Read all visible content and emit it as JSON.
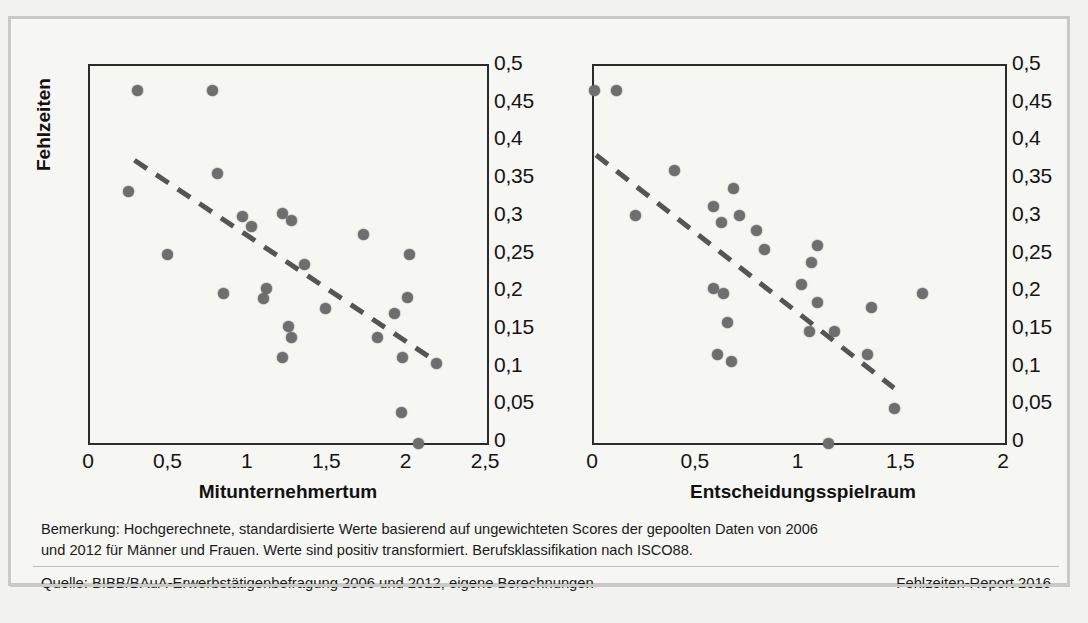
{
  "figure": {
    "note_lines": [
      "Bemerkung: Hochgerechnete, standardisierte Werte basierend auf ungewichteten Scores der gepoolten Daten von 2006",
      "und 2012 für Männer und Frauen. Werte sind positiv transformiert. Berufsklassifikation nach ISCO88."
    ],
    "source": "Quelle: BIBB/BAuA-Erwerbstätigenbefragung 2006 und 2012, eigene Berechnungen",
    "report": "Fehlzeiten-Report 2016"
  },
  "chart_data": [
    {
      "type": "scatter",
      "title": "",
      "xlabel": "Mitunternehmertum",
      "ylabel": "Fehlzeiten",
      "xlim": [
        0,
        2.5
      ],
      "ylim": [
        0,
        0.5
      ],
      "xticks": [
        "0",
        "0,5",
        "1",
        "1,5",
        "2",
        "2,5"
      ],
      "xtick_values": [
        0,
        0.5,
        1,
        1.5,
        2,
        2.5
      ],
      "yticks": [
        "0",
        "0,05",
        "0,1",
        "0,15",
        "0,2",
        "0,25",
        "0,3",
        "0,35",
        "0,4",
        "0,45",
        "0,5"
      ],
      "ytick_values": [
        0,
        0.05,
        0.1,
        0.15,
        0.2,
        0.25,
        0.3,
        0.35,
        0.4,
        0.45,
        0.5
      ],
      "grid": false,
      "legend": "none",
      "marker_color": "#6e6e6e",
      "trendline_color": "#555555",
      "trendline_style": "dashed",
      "trendline": {
        "x0": 0.28,
        "y0": 0.375,
        "x1": 2.18,
        "y1": 0.108
      },
      "points": [
        {
          "x": 0.3,
          "y": 0.468
        },
        {
          "x": 0.77,
          "y": 0.468
        },
        {
          "x": 0.8,
          "y": 0.357
        },
        {
          "x": 0.24,
          "y": 0.333
        },
        {
          "x": 0.96,
          "y": 0.3
        },
        {
          "x": 1.21,
          "y": 0.305
        },
        {
          "x": 1.27,
          "y": 0.295
        },
        {
          "x": 1.02,
          "y": 0.287
        },
        {
          "x": 1.72,
          "y": 0.277
        },
        {
          "x": 0.49,
          "y": 0.25
        },
        {
          "x": 2.01,
          "y": 0.25
        },
        {
          "x": 1.35,
          "y": 0.237
        },
        {
          "x": 1.11,
          "y": 0.205
        },
        {
          "x": 0.84,
          "y": 0.198
        },
        {
          "x": 1.09,
          "y": 0.192
        },
        {
          "x": 2.0,
          "y": 0.193
        },
        {
          "x": 1.48,
          "y": 0.178
        },
        {
          "x": 1.92,
          "y": 0.172
        },
        {
          "x": 1.25,
          "y": 0.155
        },
        {
          "x": 1.27,
          "y": 0.14
        },
        {
          "x": 1.81,
          "y": 0.14
        },
        {
          "x": 1.21,
          "y": 0.114
        },
        {
          "x": 1.97,
          "y": 0.113
        },
        {
          "x": 2.18,
          "y": 0.105
        },
        {
          "x": 1.96,
          "y": 0.04
        },
        {
          "x": 2.07,
          "y": 0.0
        }
      ]
    },
    {
      "type": "scatter",
      "title": "",
      "xlabel": "Entscheidungsspielraum",
      "ylabel": "Fehlzeiten",
      "xlim": [
        0,
        2
      ],
      "ylim": [
        0,
        0.5
      ],
      "xticks": [
        "0",
        "0,5",
        "1",
        "1,5",
        "2"
      ],
      "xtick_values": [
        0,
        0.5,
        1,
        1.5,
        2
      ],
      "yticks": [
        "0",
        "0,05",
        "0,1",
        "0,15",
        "0,2",
        "0,25",
        "0,3",
        "0,35",
        "0,4",
        "0,45",
        "0,5"
      ],
      "ytick_values": [
        0,
        0.05,
        0.1,
        0.15,
        0.2,
        0.25,
        0.3,
        0.35,
        0.4,
        0.45,
        0.5
      ],
      "grid": false,
      "legend": "none",
      "marker_color": "#6e6e6e",
      "trendline_color": "#555555",
      "trendline_style": "dashed",
      "trendline": {
        "x0": 0.01,
        "y0": 0.382,
        "x1": 1.46,
        "y1": 0.073
      },
      "points": [
        {
          "x": 0.0,
          "y": 0.468
        },
        {
          "x": 0.11,
          "y": 0.468
        },
        {
          "x": 0.39,
          "y": 0.362
        },
        {
          "x": 0.68,
          "y": 0.337
        },
        {
          "x": 0.58,
          "y": 0.313
        },
        {
          "x": 0.2,
          "y": 0.302
        },
        {
          "x": 0.71,
          "y": 0.302
        },
        {
          "x": 0.62,
          "y": 0.293
        },
        {
          "x": 0.79,
          "y": 0.282
        },
        {
          "x": 0.83,
          "y": 0.257
        },
        {
          "x": 1.09,
          "y": 0.262
        },
        {
          "x": 1.06,
          "y": 0.24
        },
        {
          "x": 1.01,
          "y": 0.21
        },
        {
          "x": 0.58,
          "y": 0.205
        },
        {
          "x": 0.63,
          "y": 0.198
        },
        {
          "x": 1.6,
          "y": 0.198
        },
        {
          "x": 1.09,
          "y": 0.187
        },
        {
          "x": 1.35,
          "y": 0.18
        },
        {
          "x": 0.65,
          "y": 0.16
        },
        {
          "x": 1.05,
          "y": 0.148
        },
        {
          "x": 1.17,
          "y": 0.148
        },
        {
          "x": 0.6,
          "y": 0.118
        },
        {
          "x": 1.33,
          "y": 0.117
        },
        {
          "x": 0.67,
          "y": 0.108
        },
        {
          "x": 1.46,
          "y": 0.046
        },
        {
          "x": 1.14,
          "y": 0.0
        }
      ]
    }
  ]
}
